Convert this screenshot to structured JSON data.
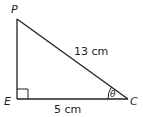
{
  "diagram": {
    "type": "right-triangle",
    "vertices": {
      "top": "P",
      "right_angle": "E",
      "right": "C"
    },
    "sides": {
      "hypotenuse_PC": "13 cm",
      "base_EC": "5 cm"
    },
    "angle": {
      "at": "C",
      "symbol": "θ"
    },
    "right_angle_marker": "E",
    "colors": {
      "stroke": "#231f20",
      "background": "#ffffff"
    }
  }
}
